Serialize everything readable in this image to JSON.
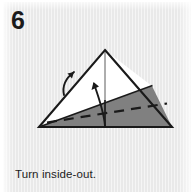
{
  "step": {
    "number": "6",
    "caption": "Turn inside-out."
  },
  "colors": {
    "background": "#e9e9e9",
    "paper_front": "#ffffff",
    "paper_back": "#808080",
    "outline": "#1a1a1a",
    "text": "#1a1a1a",
    "fold_line": "#1a1a1a",
    "arrow": "#1a1a1a"
  },
  "diagram": {
    "type": "origami-step",
    "title": "Turn inside-out.",
    "shape": "triangle",
    "vertices": {
      "apex": [
        105,
        50
      ],
      "bottom_left": [
        39,
        127
      ],
      "bottom_right": [
        172,
        127
      ]
    },
    "regions": [
      {
        "name": "white-upper-left-flap",
        "fill": "#ffffff",
        "points": "105,50 39,127 152,86"
      },
      {
        "name": "gray-lower-back-face",
        "fill": "#808080",
        "points": "39,127 172,127 152,86"
      }
    ],
    "lines": [
      {
        "name": "left-edge",
        "style": "solid",
        "from": [
          105,
          50
        ],
        "to": [
          39,
          127
        ]
      },
      {
        "name": "right-edge",
        "style": "solid",
        "from": [
          105,
          50
        ],
        "to": [
          172,
          127
        ]
      },
      {
        "name": "bottom-edge",
        "style": "solid",
        "from": [
          39,
          127
        ],
        "to": [
          172,
          127
        ]
      },
      {
        "name": "layer-boundary",
        "style": "solid",
        "from": [
          39,
          127
        ],
        "to": [
          152,
          86
        ]
      },
      {
        "name": "vertical-center-crease",
        "style": "thin-solid",
        "from": [
          105,
          52
        ],
        "to": [
          105,
          127
        ]
      },
      {
        "name": "valley-fold",
        "style": "dashed",
        "from": [
          47,
          122
        ],
        "to": [
          167,
          103
        ]
      }
    ],
    "arrows": [
      {
        "name": "left-fold-arrow",
        "direction": "up-right",
        "description": "curved arrow along left edge indicating flap lifting"
      },
      {
        "name": "center-turn-arrow",
        "direction": "up",
        "description": "curved arrow rising from bottom center indicating inside-out turn"
      }
    ]
  }
}
